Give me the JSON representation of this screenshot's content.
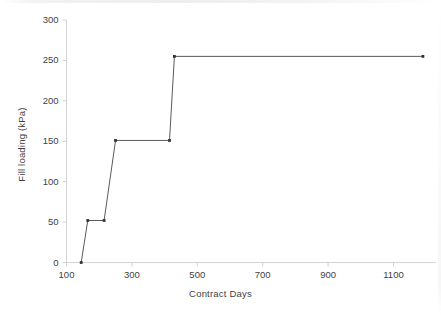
{
  "chart_data": {
    "type": "line",
    "title": "",
    "subtitle": "",
    "xlabel": "Contract Days",
    "ylabel": "Fill loading (kPa)",
    "xlim": [
      100,
      1230
    ],
    "ylim": [
      0,
      300
    ],
    "xticks": [
      100,
      300,
      500,
      700,
      900,
      1100
    ],
    "xtick_labels": [
      "100",
      "300",
      "500",
      "700",
      "900",
      "1100"
    ],
    "yticks": [
      0,
      50,
      100,
      150,
      200,
      250,
      300
    ],
    "ytick_labels": [
      "0",
      "50",
      "100",
      "150",
      "200",
      "250",
      "300"
    ],
    "grid": false,
    "legend": null,
    "legend_position": "none",
    "marker": "filled-square",
    "line_color": "#595959",
    "marker_color": "#333333",
    "series": [
      {
        "name": "Fill loading",
        "x": [
          145,
          165,
          215,
          250,
          415,
          430,
          1190
        ],
        "values": [
          0,
          52,
          52,
          151,
          151,
          255,
          255
        ]
      }
    ],
    "points": [
      {
        "x": 145,
        "y": 0
      },
      {
        "x": 165,
        "y": 52
      },
      {
        "x": 215,
        "y": 52
      },
      {
        "x": 250,
        "y": 151
      },
      {
        "x": 415,
        "y": 151
      },
      {
        "x": 430,
        "y": 255
      },
      {
        "x": 1190,
        "y": 255
      }
    ],
    "annotations": []
  },
  "axes": {
    "x_axis_label": "Contract Days",
    "y_axis_label": "Fill loading (kPa)"
  },
  "colors": {
    "background": "#ffffff",
    "axis": "#d0d0d0",
    "text": "#3f3f3f",
    "line": "#595959",
    "marker": "#333333"
  }
}
